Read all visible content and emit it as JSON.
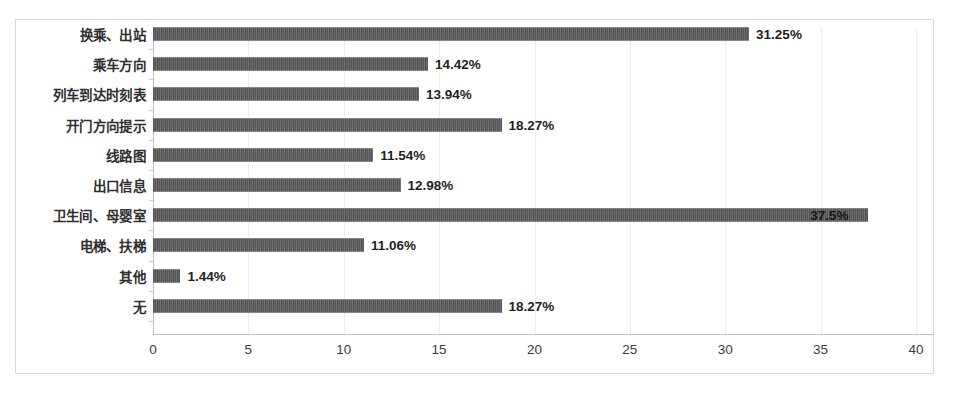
{
  "chart_data": {
    "type": "bar",
    "orientation": "horizontal",
    "title": "",
    "subtitle": "",
    "xlabel": "",
    "ylabel": "",
    "xlim": [
      0,
      40
    ],
    "xticks": [
      "0",
      "5",
      "10",
      "15",
      "20",
      "25",
      "30",
      "35",
      "40"
    ],
    "grid": true,
    "legend": "none",
    "bar_color": "#5e5e5e",
    "categories": [
      "换乘、出站",
      "乘车方向",
      "列车到达时刻表",
      "开门方向提示",
      "线路图",
      "出口信息",
      "卫生间、母婴室",
      "电梯、扶梯",
      "其他",
      "无"
    ],
    "values": [
      31.25,
      14.42,
      13.94,
      18.27,
      11.54,
      12.98,
      37.5,
      11.06,
      1.44,
      18.27
    ],
    "value_labels": [
      "31.25%",
      "14.42%",
      "13.94%",
      "18.27%",
      "11.54%",
      "12.98%",
      "37.5%",
      "11.06%",
      "1.44%",
      "18.27%"
    ],
    "label_placement": [
      "outside",
      "outside",
      "outside",
      "outside",
      "outside",
      "outside",
      "inside",
      "outside",
      "outside",
      "outside"
    ]
  }
}
